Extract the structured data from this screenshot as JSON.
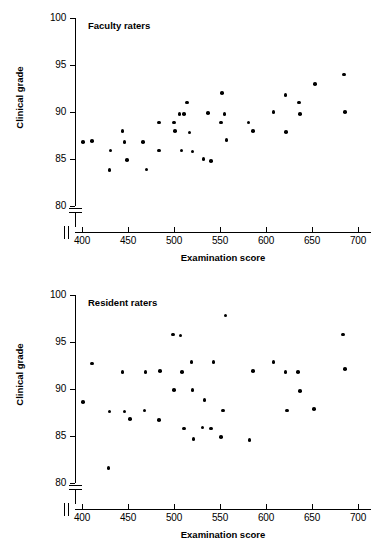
{
  "figure": {
    "axis_color": "#000000",
    "point_color": "#000000",
    "background": "#ffffff"
  },
  "chart_data": [
    {
      "type": "scatter",
      "title": "Faculty raters",
      "xlabel": "Examination score",
      "ylabel": "Clinical grade",
      "xlim": [
        390,
        705
      ],
      "ylim": [
        80,
        100
      ],
      "xticks": [
        400,
        450,
        500,
        550,
        600,
        650,
        700
      ],
      "yticks": [
        80,
        85,
        90,
        95,
        100
      ],
      "grid": false,
      "legend": "none",
      "axis_break_x": true,
      "axis_break_y": true,
      "points": [
        {
          "x": 401,
          "y": 86.8
        },
        {
          "x": 411,
          "y": 86.9
        },
        {
          "x": 430,
          "y": 83.8
        },
        {
          "x": 431,
          "y": 85.9
        },
        {
          "x": 444,
          "y": 88.0
        },
        {
          "x": 446,
          "y": 86.8
        },
        {
          "x": 449,
          "y": 84.9
        },
        {
          "x": 466,
          "y": 86.8
        },
        {
          "x": 470,
          "y": 83.9
        },
        {
          "x": 484,
          "y": 88.9
        },
        {
          "x": 484,
          "y": 85.9
        },
        {
          "x": 500,
          "y": 88.9
        },
        {
          "x": 501,
          "y": 88.0
        },
        {
          "x": 506,
          "y": 89.8
        },
        {
          "x": 508,
          "y": 85.9
        },
        {
          "x": 511,
          "y": 89.8
        },
        {
          "x": 514,
          "y": 91.0
        },
        {
          "x": 517,
          "y": 87.8
        },
        {
          "x": 520,
          "y": 85.8
        },
        {
          "x": 532,
          "y": 85.0
        },
        {
          "x": 537,
          "y": 89.9
        },
        {
          "x": 540,
          "y": 84.8
        },
        {
          "x": 551,
          "y": 88.9
        },
        {
          "x": 552,
          "y": 92.0
        },
        {
          "x": 555,
          "y": 89.8
        },
        {
          "x": 557,
          "y": 87.0
        },
        {
          "x": 581,
          "y": 88.9
        },
        {
          "x": 586,
          "y": 88.0
        },
        {
          "x": 608,
          "y": 90.0
        },
        {
          "x": 621,
          "y": 91.8
        },
        {
          "x": 622,
          "y": 87.9
        },
        {
          "x": 636,
          "y": 91.0
        },
        {
          "x": 637,
          "y": 89.8
        },
        {
          "x": 653,
          "y": 93.0
        },
        {
          "x": 685,
          "y": 94.0
        },
        {
          "x": 686,
          "y": 90.0
        }
      ]
    },
    {
      "type": "scatter",
      "title": "Resident raters",
      "xlabel": "Examination score",
      "ylabel": "Clinical grade",
      "xlim": [
        390,
        705
      ],
      "ylim": [
        80,
        100
      ],
      "xticks": [
        400,
        450,
        500,
        550,
        600,
        650,
        700
      ],
      "yticks": [
        80,
        85,
        90,
        95,
        100
      ],
      "grid": false,
      "legend": "none",
      "axis_break_x": true,
      "axis_break_y": true,
      "points": [
        {
          "x": 401,
          "y": 88.6
        },
        {
          "x": 411,
          "y": 92.7
        },
        {
          "x": 429,
          "y": 81.6
        },
        {
          "x": 430,
          "y": 87.6
        },
        {
          "x": 444,
          "y": 91.8
        },
        {
          "x": 446,
          "y": 87.6
        },
        {
          "x": 452,
          "y": 86.8
        },
        {
          "x": 468,
          "y": 87.7
        },
        {
          "x": 469,
          "y": 91.8
        },
        {
          "x": 484,
          "y": 86.7
        },
        {
          "x": 485,
          "y": 91.9
        },
        {
          "x": 499,
          "y": 95.8
        },
        {
          "x": 500,
          "y": 89.9
        },
        {
          "x": 507,
          "y": 95.7
        },
        {
          "x": 509,
          "y": 91.8
        },
        {
          "x": 511,
          "y": 85.8
        },
        {
          "x": 519,
          "y": 92.9
        },
        {
          "x": 520,
          "y": 89.9
        },
        {
          "x": 521,
          "y": 84.7
        },
        {
          "x": 531,
          "y": 85.9
        },
        {
          "x": 533,
          "y": 88.8
        },
        {
          "x": 540,
          "y": 85.8
        },
        {
          "x": 543,
          "y": 92.9
        },
        {
          "x": 551,
          "y": 84.9
        },
        {
          "x": 553,
          "y": 87.7
        },
        {
          "x": 556,
          "y": 97.8
        },
        {
          "x": 582,
          "y": 84.6
        },
        {
          "x": 586,
          "y": 91.9
        },
        {
          "x": 608,
          "y": 92.9
        },
        {
          "x": 621,
          "y": 91.8
        },
        {
          "x": 623,
          "y": 87.7
        },
        {
          "x": 635,
          "y": 91.8
        },
        {
          "x": 637,
          "y": 89.8
        },
        {
          "x": 652,
          "y": 87.9
        },
        {
          "x": 684,
          "y": 95.8
        },
        {
          "x": 686,
          "y": 92.1
        }
      ]
    }
  ]
}
